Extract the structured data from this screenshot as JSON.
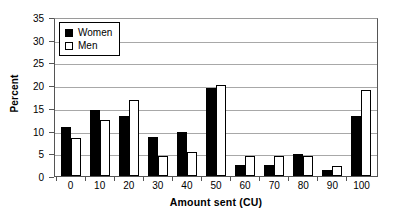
{
  "chart_data": {
    "type": "bar",
    "title": "",
    "subtitle": "",
    "xlabel": "Amount sent (CU)",
    "ylabel": "Percent",
    "categories": [
      "0",
      "10",
      "20",
      "30",
      "40",
      "50",
      "60",
      "70",
      "80",
      "90",
      "100"
    ],
    "series": [
      {
        "name": "Women",
        "color": "#000000",
        "values": [
          10.8,
          14.5,
          13.2,
          8.6,
          9.7,
          19.3,
          2.5,
          2.5,
          4.9,
          1.3,
          13.3
        ]
      },
      {
        "name": "Men",
        "color": "#FFFFFF",
        "values": [
          8.4,
          12.4,
          16.7,
          4.3,
          5.3,
          20.0,
          4.3,
          4.3,
          4.3,
          2.2,
          18.9
        ]
      }
    ],
    "ylim": [
      0,
      35
    ],
    "ytick_step": 5,
    "yticks": [
      "0",
      "5",
      "10",
      "15",
      "20",
      "25",
      "30",
      "35"
    ],
    "grid": "horizontal",
    "legend_position": "top-left",
    "legend_entries": [
      "Women",
      "Men"
    ]
  },
  "axes": {
    "y_title": "Percent",
    "x_title": "Amount sent (CU)"
  }
}
